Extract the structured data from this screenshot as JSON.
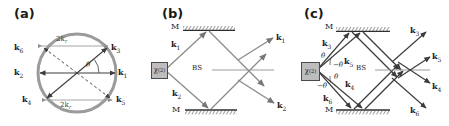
{
  "figure": {
    "width": 449,
    "height": 126,
    "background": "#ffffff",
    "stroke_dark": "#4a4a4a",
    "stroke_light": "#9b9b9b",
    "circle_color": "#9b9b9b",
    "crystal_fill": "#bdbdbd"
  },
  "panels": {
    "a": {
      "label": "(a)",
      "caption_vectors": [
        "k1",
        "k2",
        "k3",
        "k4",
        "k5",
        "k6"
      ],
      "vector_labels": {
        "k1": "k",
        "k1_sub": "1",
        "k2": "k",
        "k2_sub": "2",
        "k3": "k",
        "k3_sub": "3",
        "k4": "k",
        "k4_sub": "4",
        "k5": "k",
        "k5_sub": "5",
        "k6": "k",
        "k6_sub": "6"
      },
      "span_top": "2k",
      "span_top_sub": "r",
      "span_bottom": "2k",
      "span_bottom_sub": "r",
      "angle": "θ"
    },
    "b": {
      "label": "(b)",
      "crystal": "χ",
      "crystal_sup": "(2)",
      "mirror_top": "M",
      "mirror_bottom": "M",
      "beamsplitter": "BS",
      "in_top": "k",
      "in_top_sub": "1",
      "in_bottom": "k",
      "in_bottom_sub": "2",
      "out_top": "k",
      "out_top_sub": "1",
      "out_bottom": "k",
      "out_bottom_sub": "2"
    },
    "c": {
      "label": "(c)",
      "crystal": "χ",
      "crystal_sup": "(2)",
      "mirror_top": "M",
      "mirror_bottom": "M",
      "beamsplitter": "BS",
      "in_k3": "k",
      "in_k3_sub": "3",
      "in_k5": "k",
      "in_k5_sub": "5",
      "in_k4": "k",
      "in_k4_sub": "4",
      "in_k6": "k",
      "in_k6_sub": "6",
      "angle_upper_pos": "θ",
      "angle_upper_neg": "−θ",
      "angle_lower_pos": "θ",
      "angle_lower_neg": "−θ",
      "out_k3": "k",
      "out_k3_sub": "3",
      "out_k5": "k",
      "out_k5_sub": "5",
      "out_k4": "k",
      "out_k4_sub": "4",
      "out_k6": "k",
      "out_k6_sub": "6"
    }
  }
}
